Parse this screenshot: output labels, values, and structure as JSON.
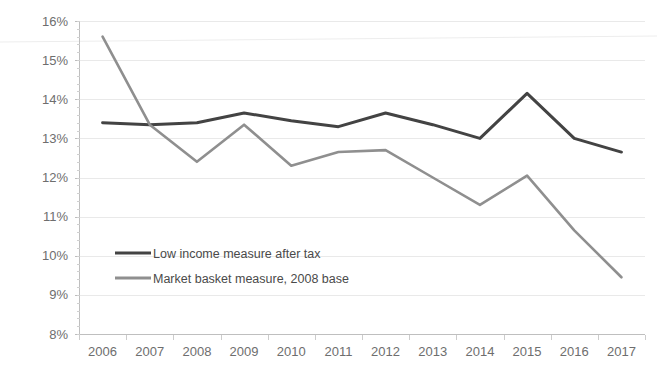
{
  "chart_data": {
    "type": "line",
    "title": "",
    "subtitle": "",
    "xlabel": "",
    "ylabel": "",
    "categories": [
      "2006",
      "2007",
      "2008",
      "2009",
      "2010",
      "2011",
      "2012",
      "2013",
      "2014",
      "2015",
      "2016",
      "2017"
    ],
    "x": [
      2006,
      2007,
      2008,
      2009,
      2010,
      2011,
      2012,
      2013,
      2014,
      2015,
      2016,
      2017
    ],
    "series": [
      {
        "name": "Low income measure after tax",
        "color": "#434343",
        "values": [
          13.4,
          13.35,
          13.4,
          13.65,
          13.45,
          13.3,
          13.65,
          13.35,
          13.0,
          14.15,
          13.0,
          12.65
        ]
      },
      {
        "name": "Market basket measure, 2008 base",
        "color": "#8f8f8f",
        "values": [
          15.6,
          13.35,
          12.4,
          13.35,
          12.3,
          12.65,
          12.7,
          12.0,
          11.3,
          12.05,
          10.65,
          9.45
        ]
      }
    ],
    "ylim": [
      8,
      16
    ],
    "ytick_labels": [
      "16%",
      "15%",
      "14%",
      "13%",
      "12%",
      "11%",
      "10%",
      "9%",
      "8%"
    ],
    "ytick_values": [
      16,
      15,
      14,
      13,
      12,
      11,
      10,
      9,
      8
    ],
    "ylim_unit": "percent",
    "grid": true,
    "grid_axis": "y",
    "legend_position": "inside-left",
    "legend": [
      {
        "label": "Low income measure after tax",
        "color": "#434343"
      },
      {
        "label": "Market basket measure, 2008 base",
        "color": "#8f8f8f"
      }
    ]
  },
  "plot_geometry": {
    "left": 79,
    "right": 645,
    "top": 21,
    "bottom": 334
  },
  "legend_geometry": {
    "x": 115,
    "swatch_width": 36,
    "row1_y": 253,
    "row2_y": 278
  }
}
